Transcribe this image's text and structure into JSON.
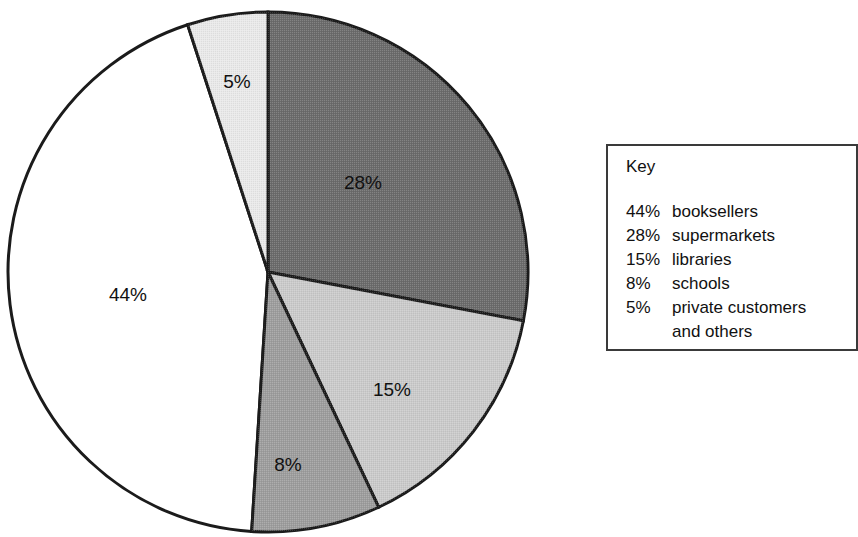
{
  "chart_data": {
    "type": "pie",
    "title": "",
    "subtitle": "",
    "xlabel": "",
    "ylabel": "",
    "grid": false,
    "legend_position": "right",
    "start_angle_deg": 0,
    "direction": "clockwise",
    "categories": [
      "booksellers",
      "supermarkets",
      "libraries",
      "schools",
      "private customers and others"
    ],
    "values": [
      44,
      28,
      15,
      8,
      5
    ],
    "unit": "%",
    "data_labels": [
      "44%",
      "28%",
      "15%",
      "8%",
      "5%"
    ],
    "slices": [
      {
        "label": "44%",
        "value": 44,
        "category": "booksellers",
        "color": "#ffffff",
        "start_deg": 183.6,
        "end_deg": 342.0,
        "label_x": 128,
        "label_y": 296
      },
      {
        "label": "28%",
        "value": 28,
        "category": "supermarkets",
        "color": "#6b6b6b",
        "start_deg": 0.0,
        "end_deg": 100.8,
        "label_x": 363,
        "label_y": 184
      },
      {
        "label": "15%",
        "value": 15,
        "category": "libraries",
        "color": "#cacaca",
        "start_deg": 100.8,
        "end_deg": 154.8,
        "label_x": 392,
        "label_y": 391
      },
      {
        "label": "8%",
        "value": 8,
        "category": "schools",
        "color": "#9d9d9d",
        "start_deg": 154.8,
        "end_deg": 183.6,
        "label_x": 288,
        "label_y": 466
      },
      {
        "label": "5%",
        "value": 5,
        "category": "private customers and others",
        "color": "#e9e9e9",
        "start_deg": 342.0,
        "end_deg": 360.0,
        "label_x": 237,
        "label_y": 83
      }
    ],
    "geometry": {
      "center_x": 268,
      "center_y": 272,
      "radius": 260,
      "outline_color": "#1b1b1b",
      "outline_width": 3
    }
  },
  "legend": {
    "title": "Key",
    "items": [
      {
        "percent": "44%",
        "name": "booksellers"
      },
      {
        "percent": "28%",
        "name": "supermarkets"
      },
      {
        "percent": "15%",
        "name": "libraries"
      },
      {
        "percent": "8%",
        "name": "schools"
      },
      {
        "percent": "5%",
        "name": "private customers"
      }
    ],
    "continuation": "and others"
  }
}
